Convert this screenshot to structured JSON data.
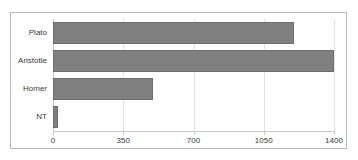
{
  "chart_data": {
    "type": "bar",
    "orientation": "horizontal",
    "title": "",
    "xlabel": "",
    "ylabel": "",
    "categories": [
      "Plato",
      "Aristotle",
      "Homer",
      "NT"
    ],
    "values": [
      1200,
      1400,
      500,
      25
    ],
    "series": [
      {
        "name": "",
        "values": [
          1200,
          1400,
          500,
          25
        ]
      }
    ],
    "xlim": [
      0,
      1400
    ],
    "xticks": [
      0,
      350,
      700,
      1050,
      1400
    ],
    "xtick_labels": [
      "0",
      "350",
      "700",
      "1050",
      "1400"
    ],
    "grid": true,
    "grid_axis": "x",
    "legend": false,
    "legend_position": "none",
    "bar_color": "#808080",
    "bar_edge_color": "#6e6e6e",
    "grid_color": "#e3e3e3",
    "axis_color": "#c9c9c9",
    "frame_color": "#b8b8b8",
    "text_color": "#3a3a3a",
    "background": "#ffffff"
  }
}
